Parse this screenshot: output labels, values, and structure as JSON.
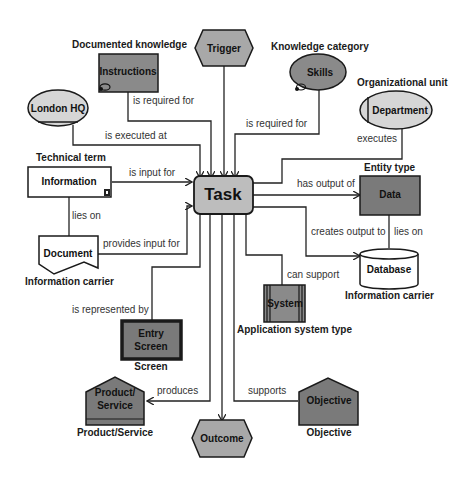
{
  "diagram": {
    "center": {
      "label": "Task"
    },
    "nodes": {
      "trigger": {
        "label": "Trigger",
        "shape": "hexagon",
        "caption": ""
      },
      "instructions": {
        "label": "Instructions",
        "shape": "rectangle",
        "caption": "Documented knowledge"
      },
      "skills": {
        "label": "Skills",
        "shape": "ellipse",
        "caption": "Knowledge category"
      },
      "london": {
        "label": "London HQ",
        "shape": "ellipse",
        "caption": ""
      },
      "department": {
        "label": "Department",
        "shape": "ellipse",
        "caption": "Organizational unit"
      },
      "information": {
        "label": "Information",
        "shape": "rectangle",
        "caption": "Technical term"
      },
      "document": {
        "label": "Document",
        "shape": "document",
        "caption": "Information carrier"
      },
      "data": {
        "label": "Data",
        "shape": "rectangle",
        "caption": "Entity type"
      },
      "database": {
        "label": "Database",
        "shape": "cylinder",
        "caption": "Information carrier"
      },
      "system": {
        "label": "System",
        "shape": "rectangle",
        "caption": "Application system type"
      },
      "entry": {
        "label_line1": "Entry",
        "label_line2": "Screen",
        "shape": "rectangle",
        "caption": "Screen"
      },
      "product": {
        "label_line1": "Product/",
        "label_line2": "Service",
        "shape": "house",
        "caption": "Product/Service"
      },
      "outcome": {
        "label": "Outcome",
        "shape": "hexagon",
        "caption": ""
      },
      "objective": {
        "label": "Objective",
        "shape": "house",
        "caption": "Objective"
      }
    },
    "edges": {
      "instructions": "is required for",
      "skills": "is required for",
      "london": "is executed at",
      "department": "executes",
      "information": "is input for",
      "info_document": "lies on",
      "document": "provides input for",
      "data": "has output of",
      "database": "creates output to",
      "data_database": "lies on",
      "system": "can support",
      "entry": "is represented by",
      "product": "produces",
      "objective": "supports"
    },
    "colors": {
      "dark_fill": "#7a7a7a",
      "mid_fill": "#a8a8a8",
      "light_fill": "#d6d6d6",
      "task_fill": "#bdbdbd",
      "stroke": "#1a1a1a"
    }
  }
}
